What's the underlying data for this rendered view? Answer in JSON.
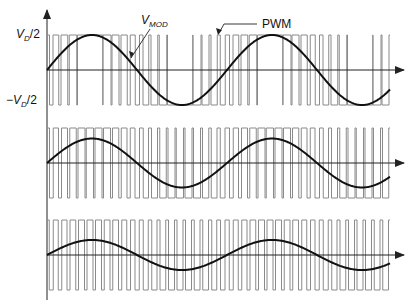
{
  "labels": {
    "vd_pos": {
      "prefix": "V",
      "sub": "D",
      "suffix": "/2"
    },
    "vd_neg": {
      "prefix": "−V",
      "sub": "D",
      "suffix": "/2"
    },
    "vmod": {
      "prefix": "V",
      "sub": "MOD"
    },
    "pwm": "PWM"
  },
  "colors": {
    "pwm": "#8a8a8a",
    "sine": "#111111",
    "axis": "#222222"
  },
  "chart_data": {
    "type": "line",
    "title": "",
    "axis": {
      "y_ticks": [
        "VD/2",
        "-VD/2"
      ],
      "x_arrow": true,
      "y_arrow": true
    },
    "x_range": [
      0,
      2
    ],
    "x_unit": "sine periods",
    "carrier_pulses_per_period": 21,
    "panels": [
      {
        "name": "high-modulation",
        "modulation_index": 1.0,
        "sine_cycles": 1.9
      },
      {
        "name": "medium-modulation",
        "modulation_index": 0.7,
        "sine_cycles": 1.9
      },
      {
        "name": "low-modulation",
        "modulation_index": 0.43,
        "sine_cycles": 1.9
      }
    ],
    "annotations": [
      {
        "text": "V_MOD",
        "points_to": "sine curve, panel 1"
      },
      {
        "text": "PWM",
        "points_to": "pulse train, panel 1"
      }
    ]
  }
}
